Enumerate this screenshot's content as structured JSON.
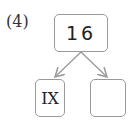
{
  "problem_label": "(4)",
  "diagram": {
    "root": {
      "value": "16"
    },
    "children": [
      {
        "value": "IX"
      },
      {
        "value": ""
      }
    ]
  },
  "colors": {
    "border": "#9a9a9a",
    "arrow": "#9a9a9a",
    "text": "#222222"
  }
}
